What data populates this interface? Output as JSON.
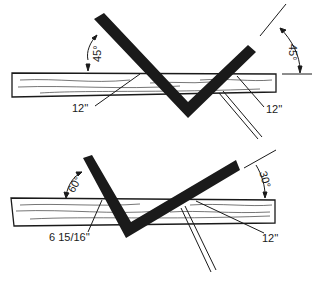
{
  "diagram": {
    "colors": {
      "ink": "#1a1a1a",
      "board": "#ffffff"
    },
    "top_panel": {
      "angle_left": "45°",
      "angle_right": "45°",
      "mark_left": "12''",
      "mark_right": "12''"
    },
    "bottom_panel": {
      "angle_left": "60°",
      "angle_right": "30°",
      "mark_left": "6 15/16''",
      "mark_right": "12''"
    }
  }
}
